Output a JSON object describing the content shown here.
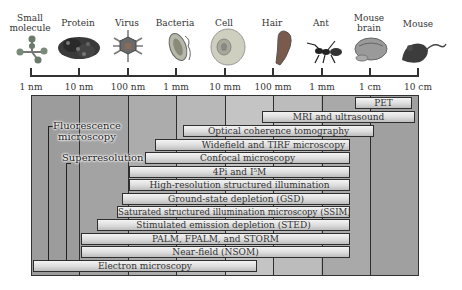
{
  "scale_objects": [
    {
      "label": "Small\nmolecule",
      "icon": "molecule-icon"
    },
    {
      "label": "Protein",
      "icon": "protein-icon"
    },
    {
      "label": "Virus",
      "icon": "virus-icon"
    },
    {
      "label": "Bacteria",
      "icon": "bacteria-icon"
    },
    {
      "label": "Cell",
      "icon": "cell-icon"
    },
    {
      "label": "Hair",
      "icon": "hair-icon"
    },
    {
      "label": "Ant",
      "icon": "ant-icon"
    },
    {
      "label": "Mouse\nbrain",
      "icon": "mouse-brain-icon"
    },
    {
      "label": "Mouse",
      "icon": "mouse-icon"
    }
  ],
  "axis": {
    "ticks": [
      "1 nm",
      "10 nm",
      "100 nm",
      "1 mm",
      "10 mm",
      "100 mm",
      "1 mm",
      "1 cm",
      "10 cm"
    ]
  },
  "groups": {
    "fluorescence": "Fluorescence\nmicroscopy",
    "superresolution": "Superresolution"
  },
  "techniques": [
    {
      "name": "PET",
      "x1": 355,
      "x2": 412,
      "y": 97
    },
    {
      "name": "MRI and ultrasound",
      "x1": 262,
      "x2": 415,
      "y": 111
    },
    {
      "name": "Optical coherence tomography",
      "x1": 183,
      "x2": 374,
      "y": 125
    },
    {
      "name": "Widefield and TIRF microscopy",
      "x1": 155,
      "x2": 350,
      "y": 139
    },
    {
      "name": "Confocal microscopy",
      "x1": 145,
      "x2": 350,
      "y": 152
    },
    {
      "name": "4Pi and I⁵M",
      "x1": 129,
      "x2": 350,
      "y": 166
    },
    {
      "name": "High-resolution structured illumination",
      "x1": 129,
      "x2": 350,
      "y": 179
    },
    {
      "name": "Ground-state depletion (GSD)",
      "x1": 122,
      "x2": 350,
      "y": 193
    },
    {
      "name": "Saturated structured illumination microscopy (SSIM)",
      "x1": 117,
      "x2": 350,
      "y": 206
    },
    {
      "name": "Stimulated emission depletion (STED)",
      "x1": 97,
      "x2": 350,
      "y": 219
    },
    {
      "name": "PALM, FPALM, and STORM",
      "x1": 81,
      "x2": 350,
      "y": 233
    },
    {
      "name": "Near-field (NSOM)",
      "x1": 81,
      "x2": 350,
      "y": 246
    },
    {
      "name": "Electron microscopy",
      "x1": 33,
      "x2": 257,
      "y": 260
    }
  ]
}
